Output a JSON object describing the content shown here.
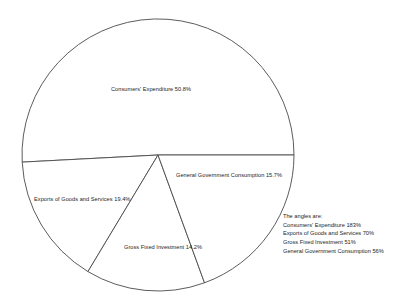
{
  "chart_data": {
    "type": "pie",
    "title": "",
    "subtitle": "",
    "xlabel": "",
    "ylabel": "",
    "grid": false,
    "legend_position": "none",
    "value_unit": "percent",
    "categories": [
      "Consumers' Expenditure",
      "General Government Consumption",
      "Gross Fixed Investment",
      "Exports of Goods and Services"
    ],
    "values": [
      50.8,
      15.7,
      14.2,
      19.4
    ],
    "angles_degrees": [
      183,
      56,
      51,
      70
    ],
    "slices": [
      {
        "name": "Consumers' Expenditure",
        "value": 50.8,
        "angle": 183,
        "label": "Consumers' Expenditure 50.8%",
        "start_angle": 0,
        "end_angle": 183
      },
      {
        "name": "General Government Consumption",
        "value": 15.7,
        "angle": 56,
        "label": "General Government Consumption 15.7%",
        "start_angle": 183,
        "end_angle": 239
      },
      {
        "name": "Gross Fixed Investment",
        "value": 14.2,
        "angle": 51,
        "label": "Gross Fixed Investment 14.2%",
        "start_angle": 239,
        "end_angle": 290
      },
      {
        "name": "Exports of Goods and Services",
        "value": 19.4,
        "angle": 70,
        "label": "Exports of Goods and Services 19.4%",
        "start_angle": 290,
        "end_angle": 360
      }
    ],
    "annotations": {
      "heading": "The angles are:",
      "rows": [
        "Consumers' Expenditure 183%",
        "Exports of Goods and Services 70%",
        "Gross Fixed Investment 51%",
        "General Government Consumption 56%"
      ]
    },
    "colors": {
      "slice_fill": "#ffffff",
      "slice_stroke": "#4a4a4a",
      "text": "#1c1c1c",
      "background": "#ffffff"
    }
  },
  "labels": {
    "consumers": "Consumers' Expenditure 50.8%",
    "government": "General Government Consumption 15.7%",
    "exports": "Exports of Goods and Services 19.4%",
    "investment": "Gross Fixed Investment 14.2%"
  },
  "angles": {
    "heading": "The angles are:",
    "consumers": "Consumers' Expenditure 183%",
    "exports": "Exports of Goods and Services 70%",
    "investment": "Gross Fixed Investment 51%",
    "government": "General Government Consumption 56%"
  }
}
